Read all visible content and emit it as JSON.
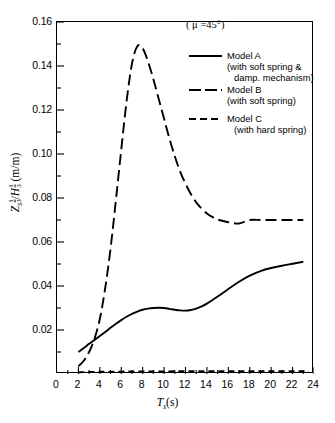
{
  "chart_data": {
    "type": "line",
    "title": "",
    "annotation": "( μ =45°)",
    "annotation_symbol": "μ",
    "annotation_value": "45°",
    "xlabel": "Tₛ(s)",
    "xlabel_main": "T",
    "xlabel_sub": "s",
    "xlabel_unit": "(s)",
    "ylabel": "Zₛ⅓/H⅓ (m/m)",
    "ylabel_main1": "Z",
    "ylabel_sub1": "s",
    "ylabel_main2": "H",
    "ylabel_unit": "(m/m)",
    "ylabel_fraction_num": "1",
    "ylabel_fraction_den": "3",
    "xlim": [
      0,
      24
    ],
    "ylim": [
      0,
      0.16
    ],
    "grid": false,
    "legend_position": "upper-right-inside",
    "xticks": [
      0,
      2,
      4,
      6,
      8,
      10,
      12,
      14,
      16,
      18,
      20,
      22,
      24
    ],
    "xtick_labels": [
      "0",
      "2",
      "4",
      "6",
      "8",
      "10",
      "12",
      "14",
      "16",
      "18",
      "20",
      "22",
      "24"
    ],
    "yticks": [
      0.02,
      0.04,
      0.06,
      0.08,
      0.1,
      0.12,
      0.14,
      0.16
    ],
    "ytick_labels": [
      "0.02",
      "0.04",
      "0.06",
      "0.08",
      "0.10",
      "0.12",
      "0.14",
      "0.16"
    ],
    "series": [
      {
        "name": "Model A",
        "description": "(with  soft  spring &  damp. mechanism)",
        "style": "solid",
        "color": "#000000",
        "x": [
          2.0,
          2.5,
          3.0,
          3.5,
          4.0,
          4.5,
          5.0,
          5.5,
          6.0,
          6.5,
          7.0,
          7.5,
          8.0,
          8.5,
          9.0,
          9.5,
          10.0,
          10.5,
          11.0,
          11.5,
          12.0,
          12.5,
          13.0,
          13.5,
          14.0,
          15.0,
          16.0,
          17.0,
          18.0,
          19.0,
          20.0,
          21.0,
          22.0,
          23.0
        ],
        "y": [
          0.01,
          0.0118,
          0.0137,
          0.0155,
          0.0173,
          0.0191,
          0.021,
          0.0228,
          0.0245,
          0.026,
          0.0273,
          0.0284,
          0.0292,
          0.0297,
          0.03,
          0.0301,
          0.03,
          0.0296,
          0.0292,
          0.0289,
          0.0288,
          0.0291,
          0.0297,
          0.0307,
          0.032,
          0.0352,
          0.0386,
          0.0419,
          0.0447,
          0.0468,
          0.0482,
          0.0492,
          0.0501,
          0.051
        ]
      },
      {
        "name": "Model B",
        "description": "(with soft spring)",
        "style": "long-dash",
        "color": "#000000",
        "x": [
          2.0,
          2.5,
          3.0,
          3.5,
          4.0,
          4.5,
          5.0,
          5.5,
          6.0,
          6.5,
          7.0,
          7.5,
          8.0,
          8.5,
          9.0,
          9.5,
          10.0,
          10.5,
          11.0,
          11.5,
          12.0,
          12.5,
          13.0,
          13.5,
          14.0,
          14.5,
          15.0,
          16.0,
          17.0,
          18.0,
          19.0,
          20.0,
          21.0,
          22.0,
          23.0
        ],
        "y": [
          0.0035,
          0.006,
          0.01,
          0.016,
          0.025,
          0.039,
          0.057,
          0.079,
          0.102,
          0.124,
          0.141,
          0.149,
          0.148,
          0.142,
          0.134,
          0.125,
          0.116,
          0.107,
          0.099,
          0.092,
          0.0865,
          0.0818,
          0.078,
          0.0752,
          0.073,
          0.0714,
          0.0702,
          0.069,
          0.0684,
          0.07,
          0.07,
          0.07,
          0.07,
          0.07,
          0.07
        ]
      },
      {
        "name": "Model C",
        "description": "(with hard spring)",
        "style": "short-dash",
        "color": "#000000",
        "x": [
          2.0,
          4.0,
          6.0,
          8.0,
          10.0,
          12.0,
          14.0,
          16.0,
          18.0,
          20.0,
          22.0,
          23.5
        ],
        "y": [
          0.0008,
          0.001,
          0.0011,
          0.0012,
          0.0012,
          0.0013,
          0.0013,
          0.0013,
          0.0013,
          0.0013,
          0.0013,
          0.0013
        ]
      }
    ]
  },
  "legend": {
    "items": [
      {
        "label": "Model A",
        "line1": "(with  soft  spring &",
        "line2": "damp. mechanism)",
        "style": "solid"
      },
      {
        "label": "Model B",
        "line1": "(with soft spring)",
        "line2": "",
        "style": "long-dash"
      },
      {
        "label": "Model C",
        "line1": "(with hard spring)",
        "line2": "",
        "style": "short-dash"
      }
    ]
  }
}
